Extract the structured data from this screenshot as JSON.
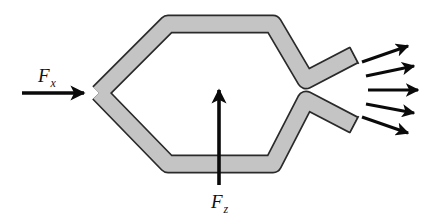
{
  "diagram": {
    "type": "force-diagram",
    "colors": {
      "pipe_fill": "#c4c4c4",
      "pipe_outline": "#2a2a2a",
      "arrow": "#0a0a0a",
      "background": "#ffffff"
    },
    "forces": [
      {
        "id": "Fx",
        "symbol": "F",
        "subscript": "x",
        "direction": "right",
        "applied_at": "left tip of body"
      },
      {
        "id": "Fz",
        "symbol": "F",
        "subscript": "z",
        "direction": "up",
        "applied_at": "bottom center of body"
      }
    ],
    "jet": {
      "arrow_count": 5,
      "direction": "right, diverging"
    }
  },
  "labels": {
    "fx_main": "F",
    "fx_sub": "x",
    "fz_main": "F",
    "fz_sub": "z"
  }
}
